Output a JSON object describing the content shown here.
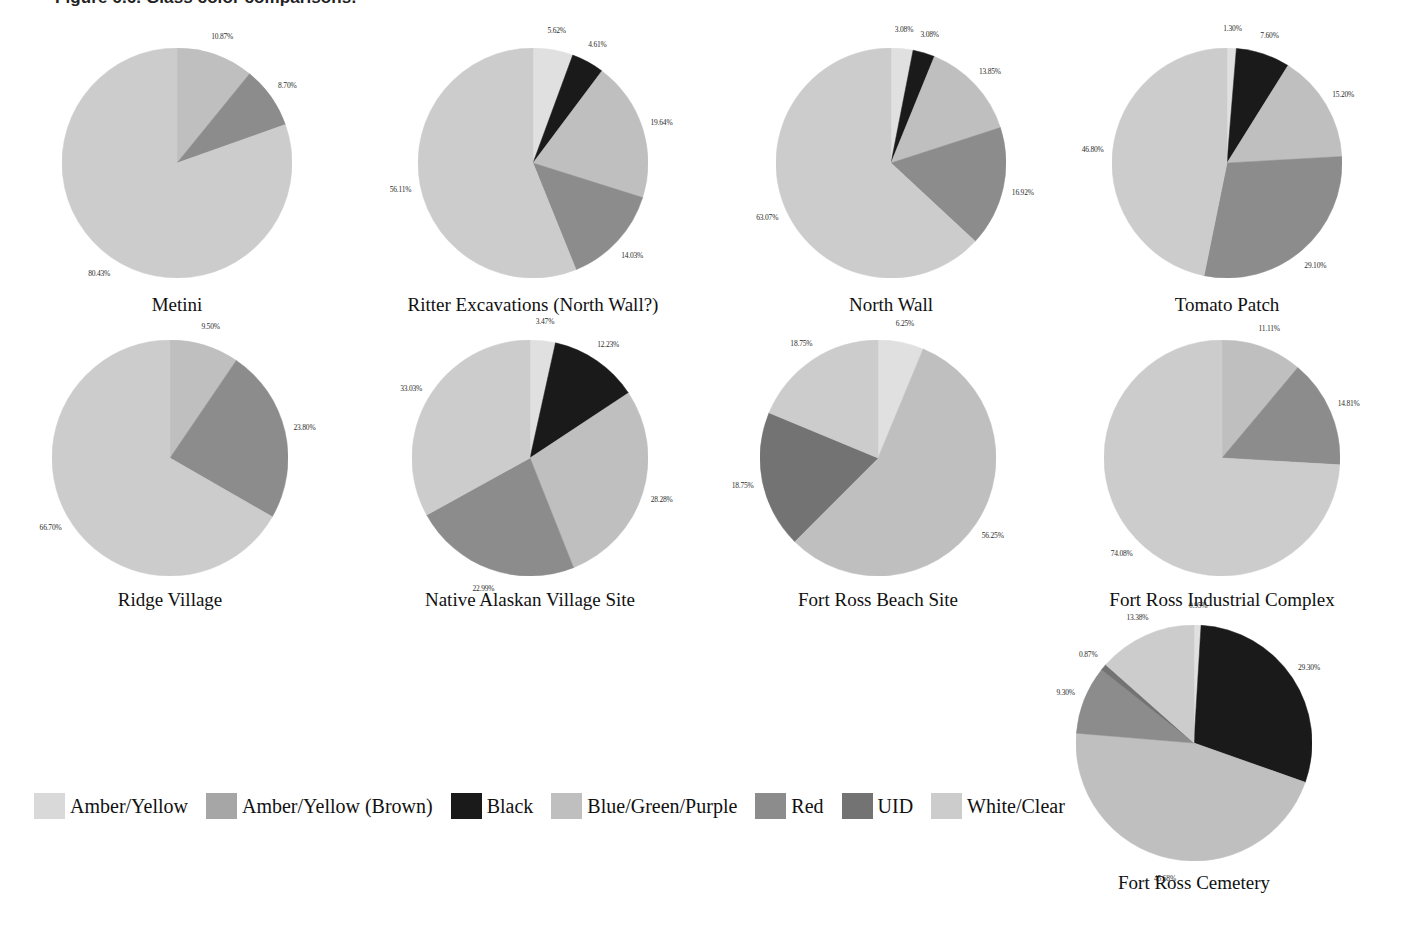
{
  "figure": {
    "caption": "Figure 6.6. Glass color comparisons."
  },
  "legend": {
    "position": "bottom-left",
    "items": [
      {
        "label": "Amber/Yellow",
        "color": "#d9d9d9"
      },
      {
        "label": "Amber/Yellow (Brown)",
        "color": "#a6a6a6"
      },
      {
        "label": "Black",
        "color": "#1a1a1a"
      },
      {
        "label": "Blue/Green/Purple",
        "color": "#bfbfbf"
      },
      {
        "label": "Red",
        "color": "#8c8c8c"
      },
      {
        "label": "UID",
        "color": "#737373"
      },
      {
        "label": "White/Clear",
        "color": "#cccccc"
      }
    ]
  },
  "chart_data": {
    "type": "pie",
    "title": "Figure 6.6. Glass color comparisons.",
    "shared_categories": [
      "Amber/Yellow",
      "Amber/Yellow (Brown)",
      "Black",
      "Blue/Green/Purple",
      "Red",
      "UID",
      "White/Clear"
    ],
    "category_colors": [
      "#d9d9d9",
      "#a6a6a6",
      "#1a1a1a",
      "#bfbfbf",
      "#8c8c8c",
      "#737373",
      "#cccccc"
    ],
    "charts": [
      {
        "title": "Metini",
        "slices": [
          {
            "category": "Blue/Green/Purple",
            "value": 10.87,
            "label": "10.87%",
            "color": "#bfbfbf"
          },
          {
            "category": "Red",
            "value": 8.7,
            "label": "8.70%",
            "color": "#8c8c8c"
          },
          {
            "category": "White/Clear",
            "value": 80.43,
            "label": "80.43%",
            "color": "#cccccc"
          }
        ]
      },
      {
        "title": "Ritter Excavations (North Wall?)",
        "slices": [
          {
            "category": "Amber/Yellow",
            "value": 5.62,
            "label": "5.62%",
            "color": "#e0e0e0"
          },
          {
            "category": "Black",
            "value": 4.61,
            "label": "4.61%",
            "color": "#1a1a1a"
          },
          {
            "category": "Blue/Green/Purple",
            "value": 19.64,
            "label": "19.64%",
            "color": "#bfbfbf"
          },
          {
            "category": "Red",
            "value": 14.03,
            "label": "14.03%",
            "color": "#8c8c8c"
          },
          {
            "category": "White/Clear",
            "value": 56.11,
            "label": "56.11%",
            "color": "#cccccc"
          }
        ]
      },
      {
        "title": "North Wall",
        "slices": [
          {
            "category": "Amber/Yellow",
            "value": 3.08,
            "label": "3.08%",
            "color": "#e0e0e0"
          },
          {
            "category": "Black",
            "value": 3.08,
            "label": "3.08%",
            "color": "#1a1a1a"
          },
          {
            "category": "Blue/Green/Purple",
            "value": 13.85,
            "label": "13.85%",
            "color": "#bfbfbf"
          },
          {
            "category": "Red",
            "value": 16.92,
            "label": "16.92%",
            "color": "#8c8c8c"
          },
          {
            "category": "White/Clear",
            "value": 63.07,
            "label": "63.07%",
            "color": "#cccccc"
          }
        ]
      },
      {
        "title": "Tomato Patch",
        "slices": [
          {
            "category": "Amber/Yellow",
            "value": 1.3,
            "label": "1.30%",
            "color": "#e0e0e0"
          },
          {
            "category": "Black",
            "value": 7.6,
            "label": "7.60%",
            "color": "#1a1a1a"
          },
          {
            "category": "Blue/Green/Purple",
            "value": 15.2,
            "label": "15.20%",
            "color": "#bfbfbf"
          },
          {
            "category": "Red",
            "value": 29.1,
            "label": "29.10%",
            "color": "#8c8c8c"
          },
          {
            "category": "White/Clear",
            "value": 46.8,
            "label": "46.80%",
            "color": "#cccccc"
          }
        ]
      },
      {
        "title": "Ridge Village",
        "slices": [
          {
            "category": "Blue/Green/Purple",
            "value": 9.5,
            "label": "9.50%",
            "color": "#bfbfbf"
          },
          {
            "category": "Red",
            "value": 23.8,
            "label": "23.80%",
            "color": "#8c8c8c"
          },
          {
            "category": "White/Clear",
            "value": 66.7,
            "label": "66.70%",
            "color": "#cccccc"
          }
        ]
      },
      {
        "title": "Native Alaskan Village Site",
        "slices": [
          {
            "category": "Amber/Yellow",
            "value": 3.47,
            "label": "3.47%",
            "color": "#e0e0e0"
          },
          {
            "category": "Black",
            "value": 12.23,
            "label": "12.23%",
            "color": "#1a1a1a"
          },
          {
            "category": "Blue/Green/Purple",
            "value": 28.28,
            "label": "28.28%",
            "color": "#bfbfbf"
          },
          {
            "category": "Red",
            "value": 22.99,
            "label": "22.99%",
            "color": "#8c8c8c"
          },
          {
            "category": "White/Clear",
            "value": 33.03,
            "label": "33.03%",
            "color": "#cccccc"
          }
        ]
      },
      {
        "title": "Fort Ross Beach Site",
        "slices": [
          {
            "category": "Amber/Yellow",
            "value": 6.25,
            "label": "6.25%",
            "color": "#e0e0e0"
          },
          {
            "category": "Blue/Green/Purple",
            "value": 56.25,
            "label": "56.25%",
            "color": "#bfbfbf"
          },
          {
            "category": "UID",
            "value": 18.75,
            "label": "18.75%",
            "color": "#737373"
          },
          {
            "category": "White/Clear",
            "value": 18.75,
            "label": "18.75%",
            "color": "#cccccc"
          }
        ]
      },
      {
        "title": "Fort Ross Industrial Complex",
        "slices": [
          {
            "category": "Blue/Green/Purple",
            "value": 11.11,
            "label": "11.11%",
            "color": "#bfbfbf"
          },
          {
            "category": "Red",
            "value": 14.81,
            "label": "14.81%",
            "color": "#8c8c8c"
          },
          {
            "category": "White/Clear",
            "value": 74.08,
            "label": "74.08%",
            "color": "#cccccc"
          }
        ]
      },
      {
        "title": "Fort Ross Cemetery",
        "slices": [
          {
            "category": "Amber/Yellow",
            "value": 0.95,
            "label": "0.95%",
            "color": "#e0e0e0"
          },
          {
            "category": "Black",
            "value": 29.3,
            "label": "29.30%",
            "color": "#1a1a1a"
          },
          {
            "category": "Blue/Green/Purple",
            "value": 45.68,
            "label": "45.68%",
            "color": "#bfbfbf"
          },
          {
            "category": "Red",
            "value": 9.3,
            "label": "9.30%",
            "color": "#8c8c8c"
          },
          {
            "category": "UID",
            "value": 0.87,
            "label": "0.87%",
            "color": "#737373"
          },
          {
            "category": "White/Clear",
            "value": 13.38,
            "label": "13.38%",
            "color": "#cccccc"
          }
        ]
      }
    ],
    "layout": {
      "positions": [
        {
          "left": 62,
          "top": 48,
          "radius": 115,
          "title_top": 290
        },
        {
          "left": 418,
          "top": 48,
          "radius": 115,
          "title_top": 290
        },
        {
          "left": 776,
          "top": 48,
          "radius": 115,
          "title_top": 290
        },
        {
          "left": 1112,
          "top": 48,
          "radius": 115,
          "title_top": 290
        },
        {
          "left": 52,
          "top": 340,
          "radius": 118,
          "title_top": 585
        },
        {
          "left": 412,
          "top": 340,
          "radius": 118,
          "title_top": 585
        },
        {
          "left": 760,
          "top": 340,
          "radius": 118,
          "title_top": 585
        },
        {
          "left": 1104,
          "top": 340,
          "radius": 118,
          "title_top": 585
        },
        {
          "left": 1076,
          "top": 625,
          "radius": 118,
          "title_top": 868
        }
      ]
    }
  }
}
